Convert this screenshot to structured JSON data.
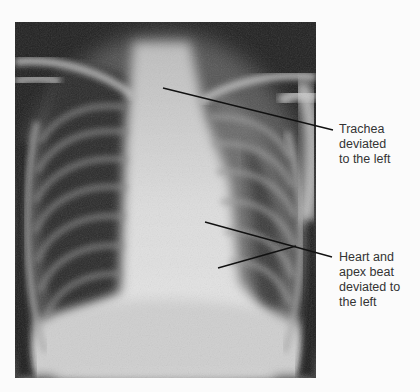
{
  "image": {
    "subject": "chest x-ray, frontal view",
    "annotations": [
      {
        "id": "trachea",
        "text_lines": [
          "Trachea",
          "deviated",
          "to the left"
        ]
      },
      {
        "id": "heart",
        "text_lines": [
          "Heart and",
          "apex beat",
          "deviated to",
          "the left"
        ]
      }
    ]
  }
}
